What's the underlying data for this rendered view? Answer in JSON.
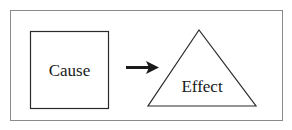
{
  "diagram": {
    "nodes": [
      {
        "id": "cause",
        "shape": "square",
        "label": "Cause"
      },
      {
        "id": "effect",
        "shape": "triangle",
        "label": "Effect"
      }
    ],
    "edges": [
      {
        "from": "cause",
        "to": "effect",
        "style": "arrow"
      }
    ],
    "colors": {
      "stroke": "#2a2a2a",
      "frame": "#8a8a8a",
      "background": "#ffffff"
    }
  }
}
